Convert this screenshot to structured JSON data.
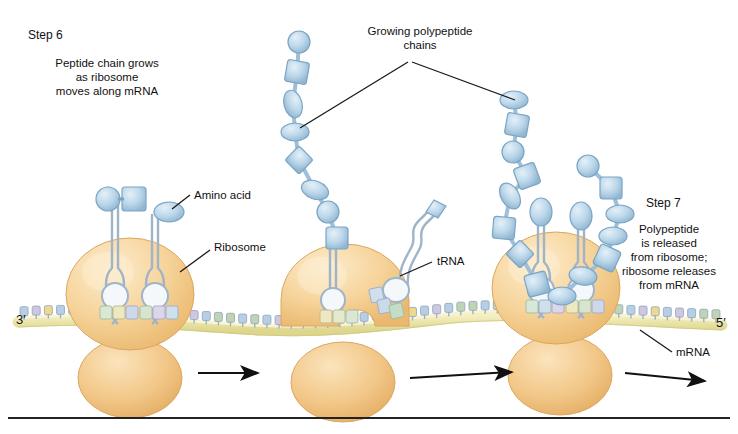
{
  "figure": {
    "background": "#ffffff"
  },
  "labels": {
    "step6_title": "Step 6",
    "step6_body": "Peptide chain grows\nas ribosome\nmoves along mRNA",
    "step7_title": "Step 7",
    "step7_body": "Polypeptide\nis released\nfrom ribosome;\nribosome releases\nfrom mRNA",
    "growing_chains": "Growing polypeptide\nchains",
    "amino_acid": "Amino acid",
    "ribosome": "Ribosome",
    "trna": "tRNA",
    "mrna": "mRNA",
    "three_prime": "3′",
    "five_prime": "5′"
  },
  "colors": {
    "background": "#ffffff",
    "text": "#111111",
    "leader_line": "#1a1a1a",
    "arrow": "#111111",
    "ribosome_large": "#f3c98b",
    "ribosome_large_light": "#fbe3bd",
    "ribosome_small": "#efc07c",
    "ribosome_outline": "#d9a95f",
    "mrna_backbone": "#ece9ae",
    "mrna_backbone_edge": "#cfc97f",
    "peptide_bead": "#b9d4e8",
    "peptide_bead_light": "#ddeaf5",
    "peptide_outline": "#7ba5c4",
    "trna_body": "#e8eef5",
    "trna_outline": "#9fb4c9",
    "nucleotide_blue": "#b7cfe4",
    "nucleotide_green": "#bfd4b4",
    "nucleotide_yellow": "#ecd98f",
    "nucleotide_lilac": "#cfc7e0",
    "baseline": "#222222"
  },
  "ribosomes": [
    {
      "name": "ribosome-left",
      "cx": 130,
      "step": "Step 6"
    },
    {
      "name": "ribosome-middle",
      "cx": 343,
      "step": ""
    },
    {
      "name": "ribosome-right",
      "cx": 556,
      "step": "Step 7"
    }
  ],
  "arrows": [
    {
      "name": "arrow-1",
      "x1": 198,
      "y1": 373,
      "x2": 258,
      "y2": 373
    },
    {
      "name": "arrow-2",
      "x1": 410,
      "y1": 378,
      "x2": 512,
      "y2": 372
    },
    {
      "name": "arrow-3",
      "x1": 625,
      "y1": 373,
      "x2": 705,
      "y2": 381
    }
  ],
  "chain_left": {
    "name": "growing-polypeptide-chain-left",
    "shapes": [
      "circle",
      "square",
      "ellipse",
      "ellipse",
      "diamond",
      "ellipse",
      "circle",
      "square"
    ],
    "count": 8
  },
  "chain_right": {
    "name": "growing-polypeptide-chain-right",
    "shapes": [
      "ellipse",
      "square",
      "circle",
      "square",
      "ellipse",
      "square",
      "diamond",
      "square",
      "ellipse",
      "ellipse",
      "square",
      "ellipse",
      "ellipse",
      "square",
      "circle"
    ],
    "count": 15
  },
  "mrna": {
    "name": "mrna-strand",
    "three_prime_end": "3′",
    "five_prime_end": "5′",
    "nucleotide_count": 58
  }
}
